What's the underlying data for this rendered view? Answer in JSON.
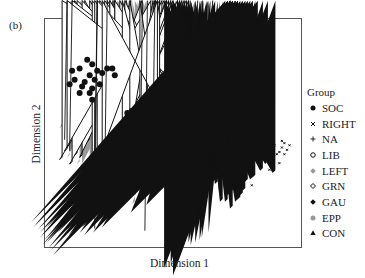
{
  "panel_label": "(b)",
  "chart_data": {
    "type": "scatter",
    "title": "",
    "xlabel": "Dimension 1",
    "ylabel": "Dimension 2",
    "grid": false,
    "axis_ticks": false,
    "legend_position": "right",
    "legend_title": "Group",
    "xlim": [
      0,
      100
    ],
    "ylim": [
      0,
      100
    ],
    "note": "Approximate point positions read in normalized plot coordinates (0-100, origin bottom-left); no numeric ticks shown.",
    "series": [
      {
        "name": "SOC",
        "marker": "filled-circle",
        "color": "#111111",
        "points": [
          [
            13,
            79
          ],
          [
            16,
            83
          ],
          [
            18,
            81
          ],
          [
            20,
            78
          ],
          [
            17,
            76
          ],
          [
            19,
            74
          ],
          [
            15,
            73
          ],
          [
            14,
            71
          ],
          [
            18,
            70
          ],
          [
            21,
            72
          ],
          [
            22,
            77
          ],
          [
            11,
            74
          ],
          [
            9,
            72
          ],
          [
            24,
            79
          ],
          [
            26,
            79
          ],
          [
            27,
            76
          ],
          [
            18,
            65
          ],
          [
            10,
            78
          ],
          [
            13,
            68
          ],
          [
            17,
            68
          ],
          [
            34,
            60
          ],
          [
            35,
            57
          ],
          [
            37,
            59
          ],
          [
            36,
            55
          ],
          [
            33,
            54
          ],
          [
            38,
            62
          ],
          [
            39,
            57
          ],
          [
            40,
            55
          ],
          [
            36,
            52
          ],
          [
            34,
            50
          ],
          [
            39,
            52
          ],
          [
            41,
            53
          ],
          [
            37,
            48
          ],
          [
            40,
            49
          ],
          [
            42,
            50
          ],
          [
            44,
            48
          ],
          [
            38,
            46
          ],
          [
            43,
            45
          ],
          [
            45,
            44
          ],
          [
            47,
            46
          ],
          [
            48,
            44
          ],
          [
            50,
            45
          ],
          [
            46,
            42
          ],
          [
            43,
            41
          ],
          [
            41,
            43
          ],
          [
            40,
            40
          ],
          [
            45,
            39
          ],
          [
            48,
            40
          ],
          [
            49,
            42
          ],
          [
            35,
            47
          ],
          [
            33,
            44
          ],
          [
            38,
            43
          ],
          [
            42,
            58
          ],
          [
            44,
            56
          ],
          [
            32,
            59
          ],
          [
            46,
            51
          ],
          [
            31,
            40
          ],
          [
            37,
            38
          ],
          [
            41,
            37
          ],
          [
            44,
            36
          ],
          [
            26,
            37
          ]
        ]
      },
      {
        "name": "RIGHT",
        "marker": "x",
        "color": "#111111",
        "points": [
          [
            94,
            43
          ],
          [
            95,
            45
          ],
          [
            96,
            42
          ],
          [
            93,
            41
          ],
          [
            97,
            44
          ],
          [
            92,
            40
          ],
          [
            91,
            44
          ],
          [
            90,
            38
          ],
          [
            93,
            36
          ],
          [
            88,
            41
          ],
          [
            84,
            42
          ],
          [
            85,
            36
          ],
          [
            89,
            33
          ],
          [
            73,
            27
          ],
          [
            82,
            26
          ],
          [
            94,
            46
          ],
          [
            95,
            40
          ]
        ]
      },
      {
        "name": "NA",
        "marker": "plus",
        "color": "#111111",
        "points": [
          [
            8,
            47
          ],
          [
            20,
            35
          ],
          [
            24,
            30
          ],
          [
            20,
            7
          ],
          [
            40,
            6
          ],
          [
            52,
            40
          ],
          [
            62,
            36
          ],
          [
            73,
            58
          ],
          [
            60,
            51
          ],
          [
            57,
            49
          ],
          [
            66,
            65
          ],
          [
            43,
            32
          ],
          [
            10,
            42
          ],
          [
            38,
            20
          ]
        ]
      },
      {
        "name": "LIB",
        "marker": "open-circle",
        "color": "#111111",
        "points": [
          [
            57,
            66
          ],
          [
            59,
            67
          ],
          [
            62,
            63
          ],
          [
            63,
            61
          ],
          [
            55,
            60
          ],
          [
            51,
            59
          ],
          [
            53,
            57
          ],
          [
            60,
            58
          ],
          [
            61,
            56
          ],
          [
            56,
            55
          ],
          [
            54,
            52
          ],
          [
            52,
            50
          ],
          [
            58,
            50
          ],
          [
            57,
            47
          ],
          [
            63,
            52
          ],
          [
            62,
            48
          ],
          [
            65,
            46
          ],
          [
            66,
            44
          ],
          [
            60,
            44
          ],
          [
            54,
            41
          ],
          [
            58,
            38
          ],
          [
            62,
            36
          ],
          [
            64,
            40
          ],
          [
            68,
            38
          ],
          [
            70,
            34
          ],
          [
            56,
            30
          ],
          [
            60,
            30
          ],
          [
            64,
            29
          ],
          [
            67,
            30
          ],
          [
            87,
            44
          ],
          [
            55,
            57
          ],
          [
            49,
            48
          ],
          [
            46,
            54
          ],
          [
            61,
            42
          ]
        ]
      },
      {
        "name": "LEFT",
        "marker": "filled-diamond",
        "color": "#999999",
        "points": [
          [
            6,
            52
          ],
          [
            17,
            47
          ],
          [
            19,
            44
          ],
          [
            23,
            43
          ],
          [
            25,
            45
          ],
          [
            28,
            48
          ],
          [
            30,
            51
          ],
          [
            9,
            39
          ],
          [
            13,
            36
          ],
          [
            21,
            33
          ],
          [
            25,
            30
          ],
          [
            20,
            28
          ],
          [
            17,
            25
          ],
          [
            24,
            26
          ],
          [
            27,
            22
          ],
          [
            29,
            19
          ],
          [
            22,
            16
          ],
          [
            28,
            15
          ],
          [
            35,
            18
          ],
          [
            31,
            36
          ],
          [
            34,
            39
          ],
          [
            39,
            44
          ],
          [
            44,
            47
          ],
          [
            49,
            53
          ],
          [
            50,
            35
          ],
          [
            29,
            44
          ],
          [
            14,
            34
          ]
        ]
      },
      {
        "name": "GRN",
        "marker": "open-diamond",
        "color": "#111111",
        "points": [
          [
            27,
            59
          ],
          [
            11,
            53
          ],
          [
            15,
            51
          ],
          [
            17,
            46
          ],
          [
            12,
            40
          ],
          [
            14,
            39
          ],
          [
            6,
            38
          ],
          [
            10,
            36
          ],
          [
            18,
            37
          ],
          [
            19,
            35
          ],
          [
            21,
            34
          ],
          [
            24,
            35
          ],
          [
            25,
            33
          ],
          [
            23,
            30
          ],
          [
            25,
            32
          ],
          [
            27,
            29
          ],
          [
            29,
            28
          ],
          [
            31,
            27
          ],
          [
            27,
            25
          ],
          [
            20,
            26
          ],
          [
            8,
            42
          ],
          [
            30,
            40
          ],
          [
            33,
            41
          ],
          [
            37,
            38
          ],
          [
            22,
            39
          ]
        ]
      },
      {
        "name": "GAU",
        "marker": "filled-diamond",
        "color": "#111111",
        "points": [
          [
            61,
            34
          ],
          [
            56,
            29
          ],
          [
            59,
            31
          ],
          [
            66,
            31
          ],
          [
            65,
            26
          ],
          [
            68,
            27
          ],
          [
            71,
            29
          ],
          [
            72,
            27
          ],
          [
            74,
            26
          ],
          [
            76,
            27
          ],
          [
            75,
            24
          ],
          [
            73,
            22
          ],
          [
            78,
            25
          ],
          [
            80,
            28
          ],
          [
            82,
            29
          ],
          [
            83,
            30
          ],
          [
            86,
            33
          ],
          [
            88,
            36
          ],
          [
            91,
            32
          ],
          [
            78,
            22
          ],
          [
            76,
            19
          ],
          [
            74,
            16
          ],
          [
            70,
            19
          ],
          [
            63,
            16
          ],
          [
            61,
            11
          ],
          [
            57,
            17
          ],
          [
            53,
            17
          ],
          [
            77,
            20
          ],
          [
            79,
            24
          ],
          [
            72,
            19
          ]
        ]
      },
      {
        "name": "EPP",
        "marker": "filled-circle",
        "color": "#999999",
        "points": [
          [
            39,
            52
          ],
          [
            40,
            49
          ],
          [
            42,
            46
          ],
          [
            41,
            44
          ],
          [
            38,
            45
          ],
          [
            36,
            49
          ],
          [
            62,
            55
          ],
          [
            63,
            52
          ],
          [
            65,
            50
          ],
          [
            64,
            47
          ],
          [
            66,
            45
          ],
          [
            68,
            46
          ],
          [
            67,
            43
          ],
          [
            62,
            44
          ],
          [
            60,
            46
          ],
          [
            61,
            49
          ],
          [
            65,
            53
          ],
          [
            69,
            41
          ],
          [
            71,
            39
          ],
          [
            72,
            37
          ],
          [
            70,
            36
          ],
          [
            68,
            35
          ],
          [
            66,
            37
          ],
          [
            64,
            40
          ],
          [
            73,
            40
          ],
          [
            74,
            37
          ],
          [
            63,
            58
          ],
          [
            66,
            57
          ],
          [
            69,
            49
          ],
          [
            71,
            44
          ],
          [
            75,
            41
          ],
          [
            76,
            36
          ]
        ]
      },
      {
        "name": "CON",
        "marker": "filled-triangle",
        "color": "#111111",
        "points": [
          [
            71,
            96
          ],
          [
            72,
            94
          ],
          [
            73,
            95
          ],
          [
            74,
            93
          ],
          [
            75,
            92
          ],
          [
            76,
            91
          ],
          [
            77,
            92
          ],
          [
            78,
            90
          ],
          [
            79,
            89
          ],
          [
            80,
            91
          ],
          [
            81,
            88
          ],
          [
            82,
            87
          ],
          [
            84,
            86
          ],
          [
            73,
            89
          ],
          [
            72,
            87
          ],
          [
            74,
            86
          ],
          [
            75,
            84
          ],
          [
            73,
            82
          ],
          [
            74,
            80
          ],
          [
            75,
            78
          ],
          [
            76,
            79
          ],
          [
            74,
            76
          ],
          [
            75,
            74
          ],
          [
            72,
            77
          ],
          [
            73,
            73
          ],
          [
            76,
            72
          ],
          [
            74,
            70
          ],
          [
            75,
            68
          ],
          [
            73,
            64
          ],
          [
            67,
            51
          ],
          [
            64,
            44
          ]
        ]
      }
    ]
  },
  "legend": {
    "title": "Group",
    "items": [
      {
        "label": "SOC",
        "marker": "filled-circle",
        "color": "#111111"
      },
      {
        "label": "RIGHT",
        "marker": "x",
        "color": "#111111"
      },
      {
        "label": "NA",
        "marker": "plus",
        "color": "#111111"
      },
      {
        "label": "LIB",
        "marker": "open-circle",
        "color": "#111111"
      },
      {
        "label": "LEFT",
        "marker": "filled-diamond",
        "color": "#999999"
      },
      {
        "label": "GRN",
        "marker": "open-diamond",
        "color": "#111111"
      },
      {
        "label": "GAU",
        "marker": "filled-diamond",
        "color": "#111111"
      },
      {
        "label": "EPP",
        "marker": "filled-circle",
        "color": "#999999"
      },
      {
        "label": "CON",
        "marker": "filled-triangle",
        "color": "#111111"
      }
    ]
  }
}
